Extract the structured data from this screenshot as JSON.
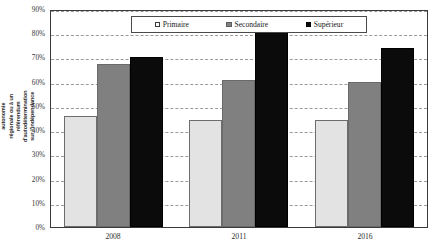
{
  "chart_data": {
    "type": "bar",
    "title": "",
    "xlabel": "",
    "ylabel": "% soutien à une plus grande autonomie régionale ou à un référendum d'autodétermination sur l'indépendance",
    "categories": [
      "2008",
      "2011",
      "2016"
    ],
    "series": [
      {
        "name": "Primaire",
        "values": [
          46,
          44,
          44
        ],
        "color": "#e3e3e3"
      },
      {
        "name": "Secondaire",
        "values": [
          67.5,
          60.5,
          60
        ],
        "color": "#808080"
      },
      {
        "name": "Supérieur",
        "values": [
          70,
          81,
          74
        ],
        "color": "#0b0b0b"
      }
    ],
    "ylim": [
      0,
      90
    ],
    "ytick_values": [
      0,
      10,
      20,
      30,
      40,
      50,
      60,
      70,
      80,
      90
    ],
    "ytick_labels": [
      "0%",
      "10%",
      "20%",
      "30%",
      "40%",
      "50%",
      "60%",
      "70%",
      "80%",
      "90%"
    ],
    "grid": true,
    "grid_style": "dashed-horizontal",
    "legend_position": "top-inside",
    "legend_entries": [
      "Primaire",
      "Secondaire",
      "Supérieur"
    ]
  }
}
